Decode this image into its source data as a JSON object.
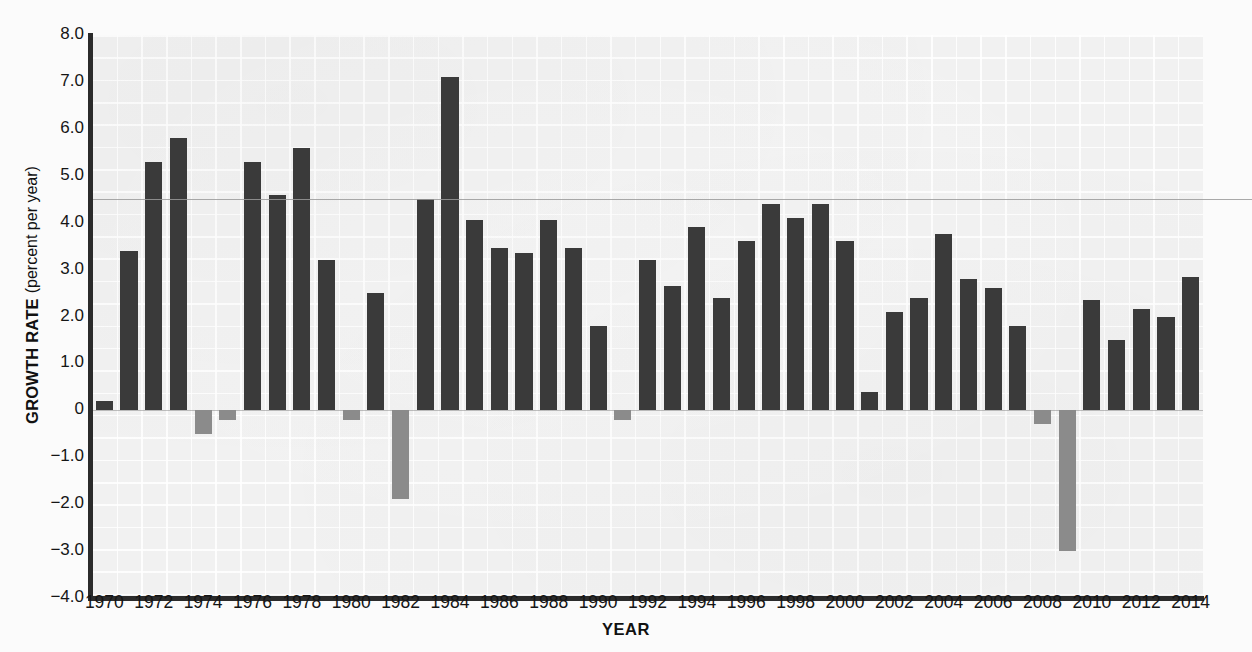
{
  "axes": {
    "ylabel_main": "GROWTH RATE",
    "ylabel_sub": "(percent per year)",
    "xlabel": "YEAR",
    "yticks": [
      "8.0",
      "7.0",
      "6.0",
      "5.0",
      "4.0",
      "3.0",
      "2.0",
      "1.0",
      "0",
      "−1.0",
      "−2.0",
      "−3.0",
      "−4.0"
    ],
    "ytick_values": [
      8,
      7,
      6,
      5,
      4,
      3,
      2,
      1,
      0,
      -1,
      -2,
      -3,
      -4
    ],
    "xticks": [
      "1970",
      "1972",
      "1974",
      "1976",
      "1978",
      "1980",
      "1982",
      "1984",
      "1986",
      "1988",
      "1990",
      "1992",
      "1994",
      "1996",
      "1998",
      "2000",
      "2002",
      "2004",
      "2006",
      "2008",
      "2010",
      "2012",
      "2014"
    ]
  },
  "colors": {
    "positive_bar": "#3a3a3a",
    "negative_bar": "#8b8b8b",
    "plot_background": "#f1f1f1",
    "axis": "#2b2b2b",
    "reference_line": "#9a9a9a"
  },
  "chart_data": {
    "type": "bar",
    "title": "",
    "subtitle": "",
    "xlabel": "YEAR",
    "ylabel": "GROWTH RATE (percent per year)",
    "ylim": [
      -4.0,
      8.0
    ],
    "xlim": [
      1969.5,
      2014.5
    ],
    "grid": true,
    "legend": "none",
    "annotations": [
      {
        "type": "horizontal-line",
        "value": 4.5,
        "note": "reference rule spanning full figure width"
      }
    ],
    "categories": [
      1970,
      1971,
      1972,
      1973,
      1974,
      1975,
      1976,
      1977,
      1978,
      1979,
      1980,
      1981,
      1982,
      1983,
      1984,
      1985,
      1986,
      1987,
      1988,
      1989,
      1990,
      1991,
      1992,
      1993,
      1994,
      1995,
      1996,
      1997,
      1998,
      1999,
      2000,
      2001,
      2002,
      2003,
      2004,
      2005,
      2006,
      2007,
      2008,
      2009,
      2010,
      2011,
      2012,
      2013,
      2014
    ],
    "values": [
      0.2,
      3.4,
      5.3,
      5.8,
      -0.5,
      -0.2,
      5.3,
      4.6,
      5.6,
      3.2,
      -0.2,
      2.5,
      -1.9,
      4.5,
      7.1,
      4.05,
      3.45,
      3.35,
      4.05,
      3.45,
      1.8,
      -0.2,
      3.2,
      2.65,
      3.9,
      2.4,
      3.6,
      4.4,
      4.1,
      4.4,
      3.6,
      0.4,
      2.1,
      2.4,
      3.75,
      2.8,
      2.6,
      1.8,
      -0.3,
      -3.0,
      2.35,
      1.5,
      2.15,
      2.0,
      2.85
    ]
  }
}
